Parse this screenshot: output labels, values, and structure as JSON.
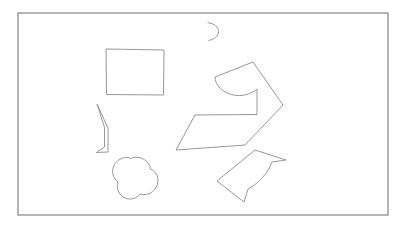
{
  "page": {
    "background_color": "#ffffff",
    "width": 411,
    "height": 231
  },
  "frame": {
    "name": "outer-border-rectangle",
    "stroke_color": "#7a7a7a",
    "x": 18,
    "y": 13,
    "width": 370,
    "height": 202
  },
  "style": {
    "shape_stroke_color": "#8c8c8c",
    "shape_stroke_width": 0.9,
    "fill": "none"
  },
  "shapes": [
    {
      "id": "rectangle",
      "label": "Rectangle",
      "type": "rectangle",
      "x": 106,
      "y": 49,
      "width": 58,
      "height": 46,
      "path": "M 106 49 L 164 50 L 163.5 95 L 106.5 94.5 Z"
    },
    {
      "id": "crescent-arc",
      "label": "Crescent Arc",
      "type": "arc",
      "center_x": 210,
      "center_y": 31,
      "radius": 9,
      "opening": "left",
      "path": "M 207.5 22.5 C 214.5 23.5 218.5 27 218.5 31.5 C 218.5 36 214.5 39.5 208.5 40.5"
    },
    {
      "id": "hook-sliver",
      "label": "Thin Hook Sliver",
      "type": "freeform-sliver",
      "path": "M 97 104 L 108 128 L 108 152 L 96.5 152.5 L 104.5 147 L 104.5 127.5 Z"
    },
    {
      "id": "clover-cloud",
      "label": "Clover Cloud",
      "type": "freeform-lobed",
      "center_x": 133,
      "center_y": 178,
      "lobes": 3,
      "path": "M 133 157.5 C 141.5 156 149.5 161 150.5 169 C 157 171.5 159.5 179 157 185.5 C 154.5 192.5 147 196 140 194 C 136.5 199 129.5 200.5 124 197.5 C 118.5 194.5 116 188 118 182 C 112.5 178 111 170.5 114.5 164.5 C 118 158.5 125.5 156 132 158.5 Z"
    },
    {
      "id": "arrow-polygon",
      "label": "Arrow Polygon with Concave Bite",
      "type": "freeform-polygon-with-arc",
      "path": "M 215 77 L 253 62 L 283 105 L 245 145 L 176 150 L 195 115 L 257 114.5 L 257 89 C 245 99 228 97 219 87 C 216.5 84 215 80.5 215 77 Z"
    },
    {
      "id": "quad-arc",
      "label": "Quadrilateral with Concave Arc",
      "type": "freeform-polygon-with-arc",
      "path": "M 255 150 L 286 160 L 272 162 C 268 173 259 183 248 189 L 244 202 L 217 181 Z"
    }
  ],
  "shape_count": 6
}
